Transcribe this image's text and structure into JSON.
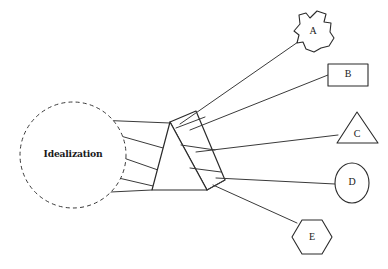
{
  "diagram": {
    "type": "concept-diagram",
    "background_color": "#ffffff",
    "stroke_color": "#2b2b2b",
    "source": {
      "label": "Idealization",
      "shape": "dashed-circle",
      "center": [
        73,
        155
      ],
      "radius": 53
    },
    "prism": {
      "shape": "triangular-prism",
      "front_triangle": [
        [
          170,
          122
        ],
        [
          152,
          190
        ],
        [
          207,
          190
        ]
      ],
      "right_face": [
        [
          170,
          122
        ],
        [
          196,
          111
        ],
        [
          225,
          180
        ],
        [
          207,
          190
        ]
      ],
      "note": "3D prism with visible right parallelogram face"
    },
    "rays_in": {
      "count": 5,
      "from": "Idealization",
      "to": "prism"
    },
    "rays_out": {
      "count": 5,
      "from": "prism",
      "to": [
        "A",
        "B",
        "C",
        "D",
        "E"
      ]
    },
    "outputs": [
      {
        "label": "A",
        "shape": "irregular-blob",
        "center": [
          313,
          33
        ],
        "size": 28
      },
      {
        "label": "B",
        "shape": "rectangle",
        "center": [
          348,
          75
        ],
        "size": 22
      },
      {
        "label": "C",
        "shape": "triangle",
        "center": [
          357,
          133
        ],
        "size": 22
      },
      {
        "label": "D",
        "shape": "ellipse",
        "center": [
          352,
          183
        ],
        "size": 20
      },
      {
        "label": "E",
        "shape": "hexagon",
        "center": [
          312,
          237
        ],
        "size": 20
      }
    ]
  }
}
